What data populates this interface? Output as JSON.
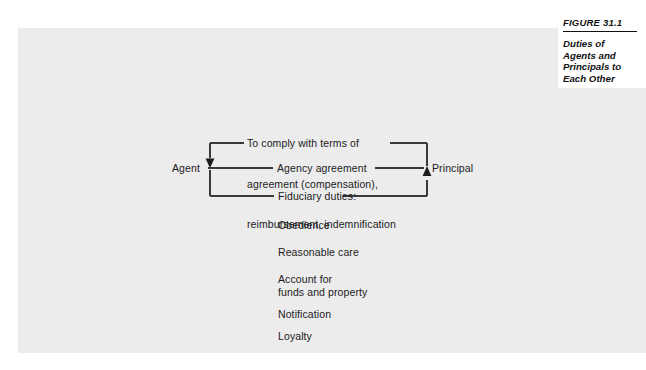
{
  "figure": {
    "number": "FIGURE 31.1",
    "title_lines": [
      "Duties of",
      "Agents and",
      "Principals to",
      "Each Other"
    ]
  },
  "diagram": {
    "type": "relationship-flow",
    "left_party": "Agent",
    "right_party": "Principal",
    "center_relation": "Agency agreement",
    "principal_to_agent_duties_lines": [
      "To comply with terms of",
      "agreement (compensation),",
      "reimbursement, indemnification"
    ],
    "agent_to_principal_heading": "Fiduciary duties:",
    "fiduciary_duties": [
      "Obedience",
      "Reasonable care",
      "Account for\nfunds and property",
      "Notification",
      "Loyalty"
    ],
    "arrow_top_direction": "principal-to-agent",
    "arrow_bottom_direction": "agent-to-principal"
  },
  "colors": {
    "panel_background": "#ececed",
    "page_background": "#ffffff",
    "line": "#3a3a3a",
    "text": "#1b1b1b",
    "caption_text": "#111111"
  }
}
